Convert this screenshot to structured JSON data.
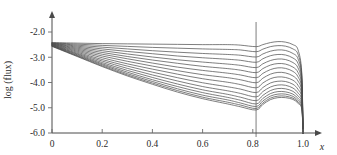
{
  "chart_data": {
    "type": "line",
    "title": "",
    "subtitle": "",
    "xlabel": "x",
    "ylabel": "log (flux)",
    "xlim": [
      0.0,
      1.05
    ],
    "ylim": [
      -6.0,
      -1.8
    ],
    "xticks": [
      0,
      0.2,
      0.4,
      0.6,
      0.8,
      1.0
    ],
    "xtick_labels": [
      "0",
      "0.2",
      "0.4",
      "0.6",
      "0.8",
      "1.0"
    ],
    "yticks": [
      -2.0,
      -3.0,
      -4.0,
      -5.0,
      -6.0
    ],
    "ytick_labels": [
      "-2.0",
      "-3.0",
      "-4.0",
      "-5.0",
      "-6.0"
    ],
    "grid": false,
    "legend": null,
    "annotations": [
      {
        "name": "vertical-marker-line",
        "type": "vline",
        "x": 0.813,
        "label": ""
      }
    ],
    "series": [
      {
        "name": "curve-1",
        "x": [
          0.0,
          0.1,
          0.2,
          0.3,
          0.4,
          0.5,
          0.6,
          0.7,
          0.75,
          0.813,
          0.84,
          0.87,
          0.9,
          0.93,
          0.96,
          0.98,
          0.995,
          1.0
        ],
        "y": [
          -2.42,
          -2.44,
          -2.46,
          -2.47,
          -2.48,
          -2.49,
          -2.5,
          -2.5,
          -2.52,
          -2.58,
          -2.5,
          -2.42,
          -2.38,
          -2.4,
          -2.5,
          -2.7,
          -3.6,
          -6.0
        ]
      },
      {
        "name": "curve-2",
        "x": [
          0.0,
          0.1,
          0.2,
          0.3,
          0.4,
          0.5,
          0.6,
          0.7,
          0.75,
          0.813,
          0.84,
          0.87,
          0.9,
          0.93,
          0.96,
          0.98,
          0.995,
          1.0
        ],
        "y": [
          -2.43,
          -2.48,
          -2.53,
          -2.57,
          -2.61,
          -2.64,
          -2.67,
          -2.69,
          -2.71,
          -2.78,
          -2.68,
          -2.58,
          -2.54,
          -2.56,
          -2.67,
          -2.88,
          -3.7,
          -6.0
        ]
      },
      {
        "name": "curve-3",
        "x": [
          0.0,
          0.1,
          0.2,
          0.3,
          0.4,
          0.5,
          0.6,
          0.7,
          0.75,
          0.813,
          0.84,
          0.87,
          0.9,
          0.93,
          0.96,
          0.98,
          0.995,
          1.0
        ],
        "y": [
          -2.44,
          -2.52,
          -2.6,
          -2.67,
          -2.74,
          -2.8,
          -2.85,
          -2.89,
          -2.92,
          -2.99,
          -2.87,
          -2.76,
          -2.71,
          -2.73,
          -2.85,
          -3.06,
          -3.8,
          -6.0
        ]
      },
      {
        "name": "curve-4",
        "x": [
          0.0,
          0.1,
          0.2,
          0.3,
          0.4,
          0.5,
          0.6,
          0.7,
          0.75,
          0.813,
          0.84,
          0.87,
          0.9,
          0.93,
          0.96,
          0.98,
          0.995,
          1.0
        ],
        "y": [
          -2.45,
          -2.56,
          -2.67,
          -2.77,
          -2.86,
          -2.95,
          -3.02,
          -3.08,
          -3.12,
          -3.2,
          -3.06,
          -2.94,
          -2.89,
          -2.91,
          -3.03,
          -3.24,
          -3.92,
          -6.0
        ]
      },
      {
        "name": "curve-5",
        "x": [
          0.0,
          0.1,
          0.2,
          0.3,
          0.4,
          0.5,
          0.6,
          0.7,
          0.75,
          0.813,
          0.84,
          0.87,
          0.9,
          0.93,
          0.96,
          0.98,
          0.995,
          1.0
        ],
        "y": [
          -2.46,
          -2.6,
          -2.74,
          -2.87,
          -2.99,
          -3.1,
          -3.19,
          -3.27,
          -3.32,
          -3.41,
          -3.26,
          -3.13,
          -3.07,
          -3.09,
          -3.21,
          -3.42,
          -4.04,
          -6.0
        ]
      },
      {
        "name": "curve-6",
        "x": [
          0.0,
          0.1,
          0.2,
          0.3,
          0.4,
          0.5,
          0.6,
          0.7,
          0.75,
          0.813,
          0.84,
          0.87,
          0.9,
          0.93,
          0.96,
          0.98,
          0.995,
          1.0
        ],
        "y": [
          -2.47,
          -2.64,
          -2.81,
          -2.97,
          -3.11,
          -3.24,
          -3.36,
          -3.45,
          -3.51,
          -3.61,
          -3.45,
          -3.31,
          -3.25,
          -3.27,
          -3.39,
          -3.6,
          -4.16,
          -6.0
        ]
      },
      {
        "name": "curve-7",
        "x": [
          0.0,
          0.1,
          0.2,
          0.3,
          0.4,
          0.5,
          0.6,
          0.7,
          0.75,
          0.813,
          0.84,
          0.87,
          0.9,
          0.93,
          0.96,
          0.98,
          0.995,
          1.0
        ],
        "y": [
          -2.48,
          -2.68,
          -2.88,
          -3.06,
          -3.23,
          -3.39,
          -3.52,
          -3.63,
          -3.7,
          -3.81,
          -3.64,
          -3.49,
          -3.42,
          -3.44,
          -3.56,
          -3.77,
          -4.28,
          -6.0
        ]
      },
      {
        "name": "curve-8",
        "x": [
          0.0,
          0.1,
          0.2,
          0.3,
          0.4,
          0.5,
          0.6,
          0.7,
          0.75,
          0.813,
          0.84,
          0.87,
          0.9,
          0.93,
          0.96,
          0.98,
          0.995,
          1.0
        ],
        "y": [
          -2.49,
          -2.72,
          -2.95,
          -3.16,
          -3.35,
          -3.53,
          -3.69,
          -3.81,
          -3.89,
          -4.01,
          -3.83,
          -3.67,
          -3.6,
          -3.62,
          -3.74,
          -3.94,
          -4.4,
          -6.0
        ]
      },
      {
        "name": "curve-9",
        "x": [
          0.0,
          0.1,
          0.2,
          0.3,
          0.4,
          0.5,
          0.6,
          0.7,
          0.75,
          0.813,
          0.84,
          0.87,
          0.9,
          0.93,
          0.96,
          0.98,
          0.995,
          1.0
        ],
        "y": [
          -2.5,
          -2.76,
          -3.02,
          -3.26,
          -3.47,
          -3.67,
          -3.85,
          -3.99,
          -4.08,
          -4.21,
          -4.02,
          -3.85,
          -3.78,
          -3.8,
          -3.91,
          -4.11,
          -4.52,
          -6.0
        ]
      },
      {
        "name": "curve-10",
        "x": [
          0.0,
          0.1,
          0.2,
          0.3,
          0.4,
          0.5,
          0.6,
          0.7,
          0.75,
          0.813,
          0.84,
          0.87,
          0.9,
          0.93,
          0.96,
          0.98,
          0.995,
          1.0
        ],
        "y": [
          -2.51,
          -2.8,
          -3.09,
          -3.35,
          -3.59,
          -3.81,
          -4.01,
          -4.17,
          -4.26,
          -4.4,
          -4.2,
          -4.02,
          -3.95,
          -3.96,
          -4.07,
          -4.27,
          -4.63,
          -6.0
        ]
      },
      {
        "name": "curve-11",
        "x": [
          0.0,
          0.1,
          0.2,
          0.3,
          0.4,
          0.5,
          0.6,
          0.7,
          0.75,
          0.813,
          0.84,
          0.87,
          0.9,
          0.93,
          0.96,
          0.98,
          0.995,
          1.0
        ],
        "y": [
          -2.52,
          -2.84,
          -3.15,
          -3.44,
          -3.7,
          -3.94,
          -4.16,
          -4.33,
          -4.43,
          -4.57,
          -4.36,
          -4.18,
          -4.1,
          -4.11,
          -4.22,
          -4.41,
          -4.73,
          -6.0
        ]
      },
      {
        "name": "curve-12",
        "x": [
          0.0,
          0.1,
          0.2,
          0.3,
          0.4,
          0.5,
          0.6,
          0.7,
          0.75,
          0.813,
          0.84,
          0.87,
          0.9,
          0.93,
          0.96,
          0.98,
          0.995,
          1.0
        ],
        "y": [
          -2.53,
          -2.87,
          -3.21,
          -3.52,
          -3.8,
          -4.06,
          -4.29,
          -4.47,
          -4.58,
          -4.72,
          -4.51,
          -4.32,
          -4.24,
          -4.25,
          -4.35,
          -4.53,
          -4.82,
          -6.0
        ]
      },
      {
        "name": "curve-13",
        "x": [
          0.0,
          0.1,
          0.2,
          0.3,
          0.4,
          0.5,
          0.6,
          0.7,
          0.75,
          0.813,
          0.84,
          0.87,
          0.9,
          0.93,
          0.96,
          0.98,
          0.995,
          1.0
        ],
        "y": [
          -2.54,
          -2.9,
          -3.26,
          -3.59,
          -3.89,
          -4.16,
          -4.4,
          -4.59,
          -4.7,
          -4.85,
          -4.63,
          -4.44,
          -4.36,
          -4.37,
          -4.46,
          -4.63,
          -4.9,
          -6.0
        ]
      },
      {
        "name": "curve-14",
        "x": [
          0.0,
          0.1,
          0.2,
          0.3,
          0.4,
          0.5,
          0.6,
          0.7,
          0.75,
          0.813,
          0.84,
          0.87,
          0.9,
          0.93,
          0.96,
          0.98,
          0.995,
          1.0
        ],
        "y": [
          -2.55,
          -2.93,
          -3.3,
          -3.65,
          -3.96,
          -4.25,
          -4.5,
          -4.69,
          -4.81,
          -4.95,
          -4.73,
          -4.54,
          -4.46,
          -4.46,
          -4.55,
          -4.71,
          -4.96,
          -6.0
        ]
      },
      {
        "name": "curve-15",
        "x": [
          0.0,
          0.1,
          0.2,
          0.3,
          0.4,
          0.5,
          0.6,
          0.7,
          0.75,
          0.813,
          0.84,
          0.87,
          0.9,
          0.93,
          0.96,
          0.98,
          0.995,
          1.0
        ],
        "y": [
          -2.56,
          -2.95,
          -3.34,
          -3.7,
          -4.02,
          -4.32,
          -4.58,
          -4.78,
          -4.89,
          -5.03,
          -4.81,
          -4.62,
          -4.54,
          -4.54,
          -4.62,
          -4.77,
          -5.01,
          -6.0
        ]
      },
      {
        "name": "curve-16",
        "x": [
          0.0,
          0.1,
          0.2,
          0.3,
          0.4,
          0.5,
          0.6,
          0.7,
          0.75,
          0.813,
          0.84,
          0.87,
          0.9,
          0.93,
          0.96,
          0.98,
          0.995,
          1.0
        ],
        "y": [
          -2.57,
          -2.97,
          -3.37,
          -3.74,
          -4.07,
          -4.38,
          -4.64,
          -4.85,
          -4.96,
          -5.09,
          -4.87,
          -4.68,
          -4.6,
          -4.6,
          -4.67,
          -4.82,
          -5.05,
          -6.0
        ]
      }
    ]
  }
}
